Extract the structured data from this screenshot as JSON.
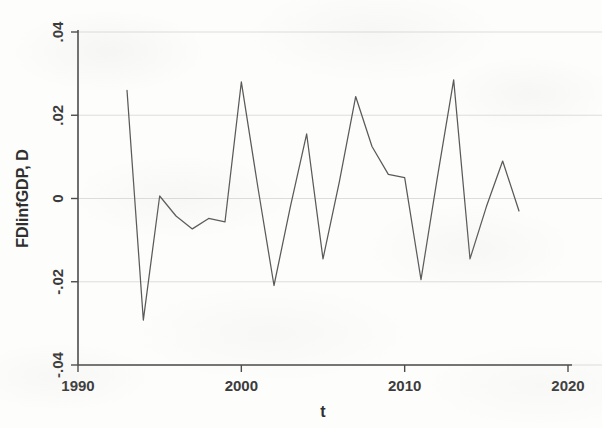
{
  "chart_data": {
    "type": "line",
    "title": "",
    "subtitle": "",
    "xlabel": "t",
    "ylabel": "FDlinfGDP, D",
    "xlim": [
      1990,
      2020
    ],
    "ylim": [
      -0.04,
      0.04
    ],
    "grid": true,
    "legend": null,
    "legend_position": "none",
    "x_ticks": [
      1990,
      2000,
      2010,
      2020
    ],
    "x_tick_labels": [
      "1990",
      "2000",
      "2010",
      "2020"
    ],
    "y_ticks": [
      -0.04,
      -0.02,
      0,
      0.02,
      0.04
    ],
    "y_tick_labels": [
      "-.04",
      "-.02",
      "0",
      ".02",
      ".04"
    ],
    "series": [
      {
        "name": "FDlinfGDP, D",
        "color": "#5a5a5a",
        "x": [
          1993,
          1994,
          1995,
          1996,
          1997,
          1998,
          1999,
          2000,
          2001,
          2002,
          2003,
          2004,
          2005,
          2006,
          2007,
          2008,
          2009,
          2010,
          2011,
          2012,
          2013,
          2014,
          2015,
          2016,
          2017
        ],
        "values": [
          0.026,
          -0.0292,
          0.0006,
          -0.0042,
          -0.0073,
          -0.0048,
          -0.0056,
          0.028,
          0.003,
          -0.0209,
          -0.002,
          0.0155,
          -0.0145,
          0.004,
          0.0245,
          0.0125,
          0.0058,
          0.005,
          -0.0195,
          0.005,
          0.0285,
          -0.0145,
          -0.002,
          0.009,
          -0.003
        ]
      }
    ]
  },
  "axes": {
    "y_axis_title": "FDlinfGDP, D",
    "x_axis_title": "t"
  },
  "figure": {
    "background_color": "#fdfdfc",
    "line_color": "#5a5a5a",
    "axis_color": "#4b4b4b",
    "grid_color": "#d9d9d6"
  }
}
